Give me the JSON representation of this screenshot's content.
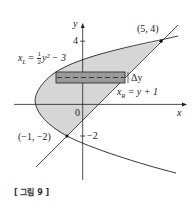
{
  "figure": {
    "caption": "[ 그림 9 ]",
    "axes": {
      "x_label": "x",
      "y_label": "y",
      "origin_label": "0",
      "y_ticks": [
        {
          "value": 4,
          "label": "4"
        },
        {
          "value": -2,
          "label": "−2"
        }
      ]
    },
    "curves": {
      "left": {
        "name": "x_L",
        "equation_lhs": "x",
        "equation_sub": "L",
        "equation_rhs_frac_num": "1",
        "equation_rhs_frac_den": "2",
        "equation_rhs_rest": "y² − 3",
        "full": "x_L = (1/2) y^2 - 3"
      },
      "right": {
        "name": "x_R",
        "equation_lhs": "x",
        "equation_sub": "R",
        "equation_rhs": " = y + 1",
        "full": "x_R = y + 1"
      }
    },
    "intersection_points": [
      {
        "label": "(5, 4)",
        "x": 5,
        "y": 4
      },
      {
        "label": "(−1, −2)",
        "x": -1,
        "y": -2
      }
    ],
    "strip_label": "Δy",
    "colors": {
      "region_fill": "#d6d6d6",
      "strip_fill": "#9a9a9a",
      "line": "#222222"
    }
  }
}
